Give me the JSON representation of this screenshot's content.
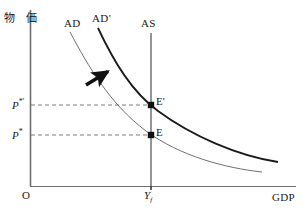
{
  "figure": {
    "type": "economics-ad-as-diagram",
    "background_color": "#ffffff",
    "ink_color": "#1a1a1a"
  },
  "axes": {
    "y_axis_label": "物 価",
    "x_axis_label": "GDP",
    "origin_label": "O",
    "y_axis_x": 30,
    "y_axis_top": 10,
    "x_axis_y": 186,
    "x_axis_right": 296
  },
  "curves": [
    {
      "name": "AD",
      "label": "AD",
      "style": "thin",
      "color": "#555555",
      "width": 0.9,
      "path": "M 70 32 C 88 66, 110 104, 146 131 C 180 156, 225 168, 262 172"
    },
    {
      "name": "AD-prime",
      "label": "AD'",
      "style": "thick",
      "color": "#1a1a1a",
      "width": 1.8,
      "path": "M 98 28 C 114 62, 132 92, 158 111 C 192 136, 238 156, 278 162"
    },
    {
      "name": "AS",
      "label": "AS",
      "style": "vertical",
      "color": "#1a1a1a",
      "width": 1.0,
      "path": "M 151 33 L 151 190"
    }
  ],
  "points": [
    {
      "name": "E",
      "label": "E",
      "x": 151,
      "y": 135,
      "price_label": "P*",
      "quantity_label": "Yf"
    },
    {
      "name": "E-prime",
      "label": "E'",
      "x": 151,
      "y": 105,
      "price_label": "P*'",
      "quantity_label": "Yf"
    }
  ],
  "price_levels": {
    "low": {
      "symbol": "P",
      "superscript": "*",
      "y": 135
    },
    "high": {
      "symbol": "P",
      "superscript": "*'",
      "y": 105
    }
  },
  "output_level": {
    "symbol": "Y",
    "subscript": "f",
    "x": 151
  },
  "annotations": [
    {
      "name": "shift-arrow",
      "type": "arrow",
      "direction": "up-right",
      "from_x": 86,
      "from_y": 85,
      "to_x": 112,
      "to_y": 69
    }
  ],
  "dashed_guides": [
    {
      "name": "guide-p-star-prime",
      "from_x": 31,
      "to_x": 151,
      "y": 105
    },
    {
      "name": "guide-p-star",
      "from_x": 31,
      "to_x": 151,
      "y": 135
    }
  ]
}
